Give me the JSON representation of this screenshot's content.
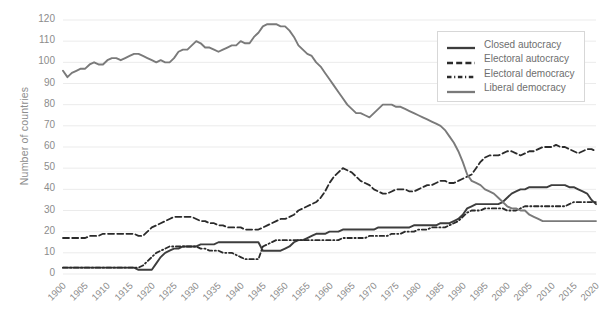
{
  "chart_data": {
    "type": "line",
    "title": "",
    "xlabel": "",
    "ylabel": "Number of countries",
    "xlim": [
      1900,
      2020
    ],
    "ylim": [
      0,
      120
    ],
    "ytick_step": 10,
    "xtick_step": 5,
    "grid": "horizontal",
    "legend_position": "top-right",
    "yticks": [
      0,
      10,
      20,
      30,
      40,
      50,
      60,
      70,
      80,
      90,
      100,
      110,
      120
    ],
    "xticks": [
      1900,
      1905,
      1910,
      1915,
      1920,
      1925,
      1930,
      1935,
      1940,
      1945,
      1950,
      1955,
      1960,
      1965,
      1970,
      1975,
      1980,
      1985,
      1990,
      1995,
      2000,
      2005,
      2010,
      2015,
      2020
    ],
    "colors": {
      "closed_autocracy": "#3d3d3d",
      "electoral_autocracy": "#2b2b2b",
      "electoral_democracy": "#2b2b2b",
      "liberal_democracy": "#7a7a7a",
      "grid": "#ebebeb",
      "text": "#8c8c8c",
      "background": "#ffffff"
    },
    "x": [
      1900,
      1901,
      1902,
      1903,
      1904,
      1905,
      1906,
      1907,
      1908,
      1909,
      1910,
      1911,
      1912,
      1913,
      1914,
      1915,
      1916,
      1917,
      1918,
      1919,
      1920,
      1921,
      1922,
      1923,
      1924,
      1925,
      1926,
      1927,
      1928,
      1929,
      1930,
      1931,
      1932,
      1933,
      1934,
      1935,
      1936,
      1937,
      1938,
      1939,
      1940,
      1941,
      1942,
      1943,
      1944,
      1945,
      1946,
      1947,
      1948,
      1949,
      1950,
      1951,
      1952,
      1953,
      1954,
      1955,
      1956,
      1957,
      1958,
      1959,
      1960,
      1961,
      1962,
      1963,
      1964,
      1965,
      1966,
      1967,
      1968,
      1969,
      1970,
      1971,
      1972,
      1973,
      1974,
      1975,
      1976,
      1977,
      1978,
      1979,
      1980,
      1981,
      1982,
      1983,
      1984,
      1985,
      1986,
      1987,
      1988,
      1989,
      1990,
      1991,
      1992,
      1993,
      1994,
      1995,
      1996,
      1997,
      1998,
      1999,
      2000,
      2001,
      2002,
      2003,
      2004,
      2005,
      2006,
      2007,
      2008,
      2009,
      2010,
      2011,
      2012,
      2013,
      2014,
      2015,
      2016,
      2017,
      2018,
      2019,
      2020
    ],
    "series": [
      {
        "name": "Closed autocracy",
        "style": "solid",
        "color": "#3d3d3d",
        "width": 1.9,
        "values": [
          3,
          3,
          3,
          3,
          3,
          3,
          3,
          3,
          3,
          3,
          3,
          3,
          3,
          3,
          3,
          3,
          3,
          2,
          2,
          2,
          2,
          5,
          8,
          10,
          11,
          12,
          12,
          13,
          13,
          13,
          13,
          14,
          14,
          14,
          14,
          15,
          15,
          15,
          15,
          15,
          15,
          15,
          15,
          15,
          15,
          11,
          11,
          11,
          11,
          11,
          12,
          13,
          15,
          16,
          16,
          17,
          18,
          19,
          19,
          19,
          20,
          20,
          20,
          21,
          21,
          21,
          21,
          21,
          21,
          21,
          21,
          22,
          22,
          22,
          22,
          22,
          22,
          22,
          22,
          23,
          23,
          23,
          23,
          23,
          23,
          24,
          24,
          24,
          25,
          26,
          28,
          31,
          32,
          33,
          33,
          33,
          33,
          33,
          33,
          34,
          36,
          38,
          39,
          40,
          40,
          41,
          41,
          41,
          41,
          41,
          42,
          42,
          42,
          42,
          41,
          41,
          40,
          39,
          38,
          35,
          33
        ]
      },
      {
        "name": "Electoral autocracy",
        "style": "dash-coarse",
        "color": "#2b2b2b",
        "width": 1.8,
        "values": [
          17,
          17,
          17,
          17,
          17,
          17,
          18,
          18,
          18,
          19,
          19,
          19,
          19,
          19,
          19,
          19,
          19,
          18,
          18,
          20,
          22,
          23,
          24,
          25,
          26,
          27,
          27,
          27,
          27,
          27,
          26,
          25,
          25,
          24,
          24,
          23,
          23,
          22,
          22,
          22,
          22,
          21,
          21,
          21,
          21,
          22,
          23,
          24,
          25,
          26,
          26,
          27,
          28,
          30,
          31,
          32,
          33,
          34,
          36,
          39,
          43,
          46,
          48,
          50,
          49,
          48,
          46,
          44,
          43,
          42,
          40,
          39,
          38,
          38,
          39,
          40,
          40,
          40,
          39,
          39,
          40,
          41,
          42,
          42,
          43,
          44,
          44,
          43,
          43,
          44,
          45,
          46,
          47,
          50,
          53,
          55,
          56,
          56,
          56,
          57,
          58,
          58,
          57,
          56,
          57,
          58,
          58,
          59,
          60,
          60,
          60,
          61,
          60,
          60,
          59,
          58,
          57,
          58,
          59,
          59,
          58
        ]
      },
      {
        "name": "Electoral democracy",
        "style": "dash-fine",
        "color": "#2b2b2b",
        "width": 1.8,
        "values": [
          3,
          3,
          3,
          3,
          3,
          3,
          3,
          3,
          3,
          3,
          3,
          3,
          3,
          3,
          3,
          3,
          3,
          3,
          4,
          6,
          8,
          10,
          11,
          12,
          13,
          13,
          13,
          13,
          13,
          13,
          13,
          12,
          12,
          11,
          11,
          11,
          10,
          10,
          10,
          9,
          8,
          7,
          7,
          7,
          7,
          13,
          14,
          15,
          16,
          16,
          16,
          16,
          16,
          16,
          16,
          16,
          16,
          16,
          16,
          16,
          16,
          16,
          16,
          17,
          17,
          17,
          17,
          17,
          17,
          18,
          18,
          18,
          18,
          18,
          19,
          19,
          19,
          20,
          20,
          20,
          21,
          21,
          21,
          22,
          22,
          22,
          22,
          23,
          24,
          25,
          27,
          29,
          30,
          30,
          30,
          31,
          31,
          31,
          31,
          31,
          30,
          30,
          30,
          31,
          32,
          32,
          32,
          32,
          32,
          32,
          32,
          32,
          32,
          32,
          33,
          34,
          34,
          34,
          34,
          34,
          34
        ]
      },
      {
        "name": "Liberal democracy",
        "style": "solid",
        "color": "#7a7a7a",
        "width": 1.9,
        "values": [
          96,
          93,
          95,
          96,
          97,
          97,
          99,
          100,
          99,
          99,
          101,
          102,
          102,
          101,
          102,
          103,
          104,
          104,
          103,
          102,
          101,
          100,
          101,
          100,
          100,
          102,
          105,
          106,
          106,
          108,
          110,
          109,
          107,
          107,
          106,
          105,
          106,
          107,
          108,
          108,
          110,
          109,
          109,
          112,
          114,
          117,
          118,
          118,
          118,
          117,
          117,
          115,
          112,
          108,
          106,
          104,
          103,
          100,
          98,
          95,
          92,
          89,
          86,
          83,
          80,
          78,
          76,
          76,
          75,
          74,
          76,
          78,
          80,
          80,
          80,
          79,
          79,
          78,
          77,
          76,
          75,
          74,
          73,
          72,
          71,
          70,
          68,
          65,
          62,
          58,
          53,
          47,
          44,
          43,
          42,
          40,
          39,
          38,
          36,
          34,
          32,
          31,
          31,
          30,
          30,
          28,
          27,
          26,
          25,
          25,
          25,
          25,
          25,
          25,
          25,
          25,
          25,
          25,
          25,
          25,
          25
        ]
      }
    ]
  },
  "legend": {
    "entries": [
      {
        "label": "Closed autocracy",
        "swatch": "solid-dark"
      },
      {
        "label": "Electoral autocracy",
        "swatch": "dash-coarse"
      },
      {
        "label": "Electoral democracy",
        "swatch": "dash-fine"
      },
      {
        "label": "Liberal democracy",
        "swatch": "solid-gray"
      }
    ]
  }
}
